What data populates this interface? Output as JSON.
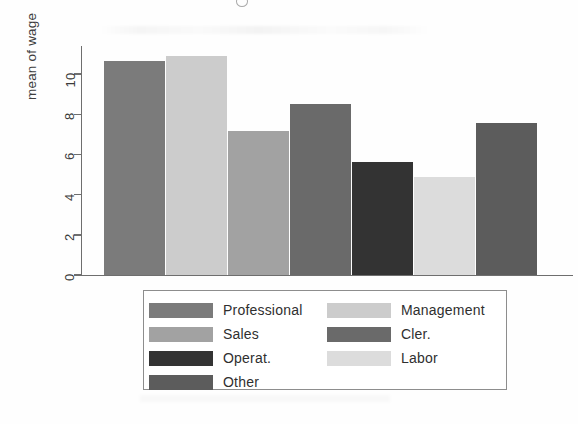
{
  "chart_data": {
    "type": "bar",
    "title": "",
    "xlabel": "",
    "ylabel": "mean of wage",
    "ylim": [
      0,
      11.4
    ],
    "grid": false,
    "legend_position": "bottom",
    "y_ticks": [
      "0",
      "2",
      "4",
      "6",
      "8",
      "10"
    ],
    "y_tick_values": [
      0,
      2,
      4,
      6,
      8,
      10
    ],
    "categories": [
      "Professional",
      "Management",
      "Sales",
      "Cler.",
      "Operat.",
      "Labor",
      "Other"
    ],
    "values": [
      10.65,
      10.9,
      7.15,
      8.5,
      5.65,
      4.9,
      7.55
    ],
    "colors": [
      "#7b7b7b",
      "#cccccc",
      "#a2a2a2",
      "#6a6a6a",
      "#333333",
      "#dcdcdc",
      "#5c5c5c"
    ],
    "bars": [
      {
        "label": "Professional",
        "value": 10.65,
        "color": "#7b7b7b",
        "left": 104,
        "width": 61
      },
      {
        "label": "Management",
        "value": 10.9,
        "color": "#cccccc",
        "left": 166,
        "width": 61
      },
      {
        "label": "Sales",
        "value": 7.15,
        "color": "#a2a2a2",
        "left": 228,
        "width": 61
      },
      {
        "label": "Cler.",
        "value": 8.5,
        "color": "#6a6a6a",
        "left": 290,
        "width": 61
      },
      {
        "label": "Operat.",
        "value": 5.65,
        "color": "#333333",
        "left": 352,
        "width": 61
      },
      {
        "label": "Labor",
        "value": 4.9,
        "color": "#dcdcdc",
        "left": 414,
        "width": 61
      },
      {
        "label": "Other",
        "value": 7.55,
        "color": "#5c5c5c",
        "left": 476,
        "width": 61
      }
    ]
  },
  "legend": {
    "left_column": [
      {
        "label": "Professional",
        "color": "#7b7b7b"
      },
      {
        "label": "Sales",
        "color": "#a2a2a2"
      },
      {
        "label": "Operat.",
        "color": "#333333"
      },
      {
        "label": "Other",
        "color": "#5c5c5c"
      }
    ],
    "right_column": [
      {
        "label": "Management",
        "color": "#cccccc"
      },
      {
        "label": "Cler.",
        "color": "#6a6a6a"
      },
      {
        "label": "Labor",
        "color": "#dcdcdc"
      }
    ]
  }
}
